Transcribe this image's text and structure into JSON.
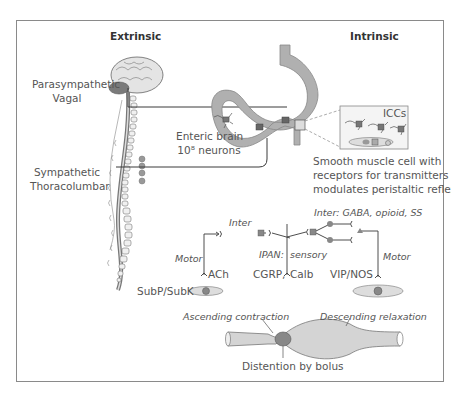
{
  "headings": {
    "extrinsic": "Extrinsic",
    "intrinsic": "Intrinsic"
  },
  "extrinsic": {
    "parasympathetic": "Parasympathetic",
    "vagal": "Vagal",
    "sympathetic": "Sympathetic",
    "thoracolumbar": "Thoracolumbar"
  },
  "intrinsic": {
    "enteric_brain": "Enteric brain",
    "neurons": "10⁸ neurons",
    "iccs": "ICCs",
    "smooth_muscle_line1": "Smooth muscle cell with",
    "smooth_muscle_line2": "receptors for transmitters",
    "smooth_muscle_line3": "modulates peristaltic reflex"
  },
  "reflex": {
    "inter_left": "Inter",
    "inter_right": "Inter: GABA, opioid, SS",
    "motor_left": "Motor",
    "motor_right": "Motor",
    "ipan": "IPAN:",
    "sensory": "sensory",
    "ach": "ACh",
    "cgrp": "CGRP,",
    "calb": "Calb",
    "vip_nos": "VIP/NOS",
    "subp_subk": "SubP/SubK"
  },
  "peristalsis": {
    "ascending": "Ascending contraction",
    "descending": "Descending relaxation",
    "distention": "Distention by bolus"
  },
  "colors": {
    "frame": "#8a8a8a",
    "line": "#3a3a3a",
    "fill_light": "#d6d6d6",
    "fill_mid": "#a8a8a8",
    "fill_dark": "#7a7a7a",
    "text": "#555555"
  }
}
